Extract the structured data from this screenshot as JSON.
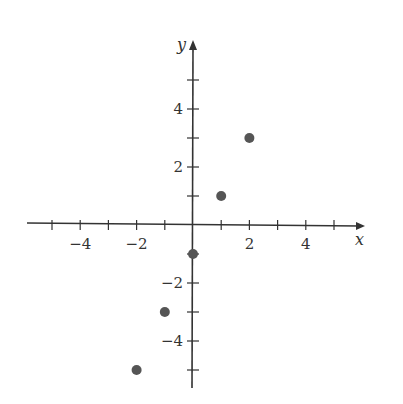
{
  "chart_data": {
    "type": "scatter",
    "title": "",
    "xlabel": "x",
    "ylabel": "y",
    "xlim": [
      -5.5,
      5.5
    ],
    "ylim": [
      -5.5,
      5.5
    ],
    "grid": false,
    "x_ticks": [
      -5,
      -4,
      -3,
      -2,
      -1,
      1,
      2,
      3,
      4,
      5
    ],
    "y_ticks": [
      -5,
      -4,
      -3,
      -2,
      -1,
      1,
      2,
      3,
      4,
      5
    ],
    "x_tick_labels": [
      {
        "v": -4,
        "t": "−4"
      },
      {
        "v": -2,
        "t": "−2"
      },
      {
        "v": 2,
        "t": "2"
      },
      {
        "v": 4,
        "t": "4"
      }
    ],
    "y_tick_labels": [
      {
        "v": 4,
        "t": "4"
      },
      {
        "v": 2,
        "t": "2"
      },
      {
        "v": -2,
        "t": "−2"
      },
      {
        "v": -4,
        "t": "−4"
      }
    ],
    "series": [
      {
        "name": "points",
        "x": [
          -2,
          -1,
          0,
          1,
          2
        ],
        "y": [
          -5,
          -3,
          -1,
          1,
          3
        ]
      }
    ],
    "colors": {
      "axis": "#333333",
      "point": "#555555"
    }
  }
}
